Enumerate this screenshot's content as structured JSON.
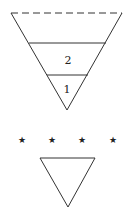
{
  "diagram": {
    "upper_triangle": {
      "top_edge_style": "dashed",
      "layers": [
        {
          "label": "2"
        },
        {
          "label": "1"
        }
      ]
    },
    "separator": {
      "symbol": "★",
      "count": 4
    },
    "lower_triangle": {
      "style": "solid"
    },
    "stroke_color": "#333333"
  }
}
